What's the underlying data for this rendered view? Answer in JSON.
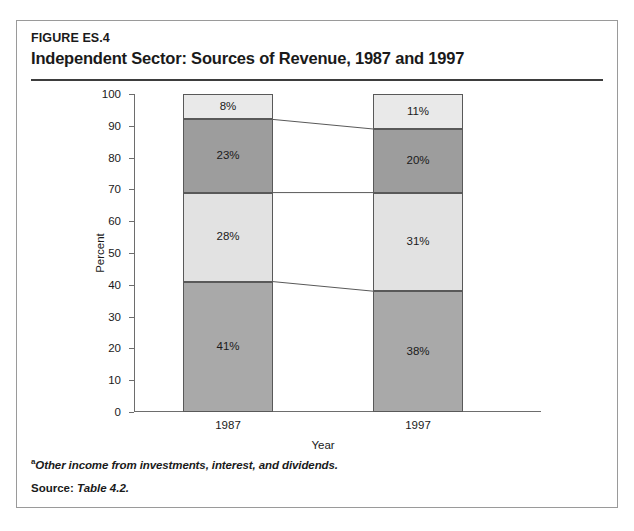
{
  "figure": {
    "number": "FIGURE ES.4",
    "title": "Independent Sector: Sources of Revenue, 1987 and 1997"
  },
  "notes": {
    "footnote_marker": "a",
    "footnote_text": "Other income from investments, interest, and dividends.",
    "source_label": "Source:",
    "source_value": "Table 4.2."
  },
  "legend": [
    {
      "label": "Other income",
      "marker": "a"
    },
    {
      "label": "Private contributions",
      "marker": ""
    },
    {
      "label": "Government contracts",
      "label2": "and grants",
      "marker": ""
    },
    {
      "label": "Private payments for",
      "label2": "dues and services",
      "marker": ""
    }
  ],
  "chart_data": {
    "type": "bar",
    "subtype": "stacked-column-100",
    "title": "Independent Sector: Sources of Revenue, 1987 and 1997",
    "xlabel": "Year",
    "ylabel": "Percent",
    "ylim": [
      0,
      100
    ],
    "yticks": [
      0,
      10,
      20,
      30,
      40,
      50,
      60,
      70,
      80,
      90,
      100
    ],
    "ytick_labels": [
      "0",
      "10",
      "20",
      "30",
      "40",
      "50",
      "60",
      "70",
      "80",
      "90",
      "100"
    ],
    "grid": false,
    "legend_position": "right",
    "categories": [
      "1987",
      "1997"
    ],
    "series": [
      {
        "name": "Private payments for dues and services",
        "values": [
          41,
          38
        ],
        "labels": [
          "41%",
          "38%"
        ],
        "color": "#a9a9a9"
      },
      {
        "name": "Government contracts and grants",
        "values": [
          28,
          31
        ],
        "labels": [
          "28%",
          "31%"
        ],
        "color": "#e2e2e2"
      },
      {
        "name": "Private contributions",
        "values": [
          23,
          20
        ],
        "labels": [
          "23%",
          "20%"
        ],
        "color": "#9d9d9d"
      },
      {
        "name": "Other income",
        "values": [
          8,
          11
        ],
        "labels": [
          "8%",
          "11%"
        ],
        "color": "#e9e9e9"
      }
    ]
  },
  "colors": {
    "border": "#9a9a9a",
    "rule": "#3d3d3d",
    "axis": "#6d6d6d",
    "segment_edge": "#595959"
  }
}
